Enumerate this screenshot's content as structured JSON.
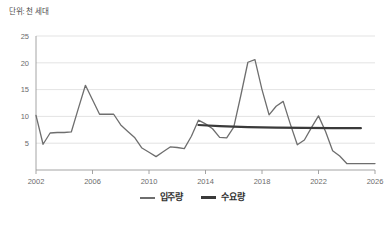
{
  "unit_note": "단위: 천 세대",
  "legend": {
    "items": [
      {
        "label": "입주량",
        "color": "#6e6e6e",
        "swatch": "line-swatch-icon"
      },
      {
        "label": "수요량",
        "color": "#3a3a3a",
        "swatch": "line-swatch-icon"
      }
    ]
  },
  "chart_data": {
    "type": "line",
    "title": "",
    "subtitle": "",
    "xlabel": "",
    "ylabel": "단위: 천 세대",
    "xlim": [
      2002,
      2026
    ],
    "ylim": [
      0,
      25
    ],
    "grid": true,
    "grid_axis": "y",
    "legend_position": "bottom-center",
    "yticks": [
      5,
      10,
      15,
      20,
      25
    ],
    "ytick_labels": [
      "5",
      "10",
      "15",
      "20",
      "25"
    ],
    "xticks": [
      2002,
      2006,
      2010,
      2014,
      2018,
      2022,
      2026
    ],
    "xtick_labels": [
      "2002",
      "2006",
      "2010",
      "2014",
      "2018",
      "2022",
      "2026"
    ],
    "series": [
      {
        "name": "입주량",
        "color": "#6e6e6e",
        "width": 1.3,
        "x": [
          2002,
          2002.5,
          2003,
          2003.5,
          2004,
          2004.5,
          2005,
          2005.5,
          2006,
          2006.5,
          2007,
          2007.5,
          2008,
          2008.5,
          2009,
          2009.5,
          2010,
          2010.5,
          2011,
          2011.5,
          2012,
          2012.5,
          2013,
          2013.5,
          2014,
          2014.5,
          2015,
          2015.5,
          2016,
          2016.5,
          2017,
          2017.5,
          2018,
          2018.5,
          2019,
          2019.5,
          2020,
          2020.5,
          2021,
          2021.5,
          2022,
          2022.5,
          2023,
          2023.5,
          2024,
          2024.5,
          2025,
          2025.5,
          2026
        ],
        "values": [
          10.2,
          4.8,
          6.9,
          7.0,
          7.0,
          7.1,
          11.5,
          15.8,
          13.1,
          10.4,
          10.4,
          10.4,
          8.4,
          7.2,
          6.0,
          4.1,
          3.3,
          2.5,
          3.4,
          4.3,
          4.2,
          4.0,
          6.3,
          9.3,
          8.6,
          7.7,
          6.1,
          6.0,
          8.0,
          13.9,
          20.1,
          20.6,
          15.0,
          10.3,
          11.9,
          12.8,
          8.6,
          4.7,
          5.6,
          7.9,
          10.1,
          7.2,
          3.6,
          2.6,
          1.2,
          1.2,
          1.2,
          1.2,
          1.2
        ]
      },
      {
        "name": "수요량",
        "color": "#3a3a3a",
        "width": 2.2,
        "x": [
          2013.5,
          2015,
          2017,
          2019,
          2021,
          2023,
          2025
        ],
        "values": [
          8.4,
          8.2,
          8.0,
          7.9,
          7.85,
          7.8,
          7.8
        ]
      }
    ]
  }
}
